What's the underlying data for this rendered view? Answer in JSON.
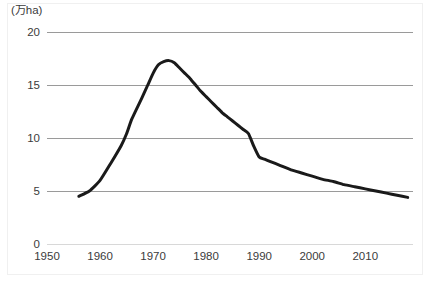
{
  "chart_data": {
    "type": "line",
    "title": "",
    "subtitle": "",
    "xlabel": "",
    "ylabel": "(万ha)",
    "unit_label": "(万ha)",
    "xlim": [
      1950,
      2019
    ],
    "ylim": [
      0,
      20
    ],
    "xticks": [
      1950,
      1960,
      1970,
      1980,
      1990,
      2000,
      2010
    ],
    "xtick_labels": [
      "1950",
      "1960",
      "1970",
      "1980",
      "1990",
      "2000",
      "2010"
    ],
    "yticks": [
      0,
      5,
      10,
      15,
      20
    ],
    "ytick_labels": [
      "0",
      "5",
      "10",
      "15",
      "20"
    ],
    "grid": "horizontal",
    "legend": "none",
    "line_color": "#1a1a1a",
    "line_width": 3,
    "grid_color": "#9a9a9a",
    "background_color": "#ffffff",
    "series": [
      {
        "name": "area",
        "x": [
          1956,
          1958,
          1960,
          1962,
          1964,
          1965,
          1966,
          1968,
          1969,
          1970,
          1971,
          1972,
          1973,
          1974,
          1975,
          1976,
          1977,
          1978,
          1979,
          1980,
          1981,
          1982,
          1983,
          1984,
          1985,
          1986,
          1987,
          1988,
          1989,
          1990,
          1991,
          1992,
          1994,
          1996,
          1998,
          2000,
          2002,
          2004,
          2006,
          2008,
          2010,
          2012,
          2014,
          2016,
          2018
        ],
        "values": [
          4.5,
          5.0,
          6.0,
          7.6,
          9.3,
          10.4,
          11.8,
          13.9,
          15.0,
          16.1,
          16.9,
          17.2,
          17.3,
          17.1,
          16.6,
          16.1,
          15.6,
          15.0,
          14.4,
          13.9,
          13.4,
          12.9,
          12.4,
          12.0,
          11.6,
          11.2,
          10.8,
          10.4,
          9.2,
          8.2,
          8.0,
          7.8,
          7.4,
          7.0,
          6.7,
          6.4,
          6.1,
          5.9,
          5.6,
          5.4,
          5.2,
          5.0,
          4.8,
          4.6,
          4.4
        ]
      }
    ],
    "annotations": {
      "peak_year": 1973,
      "peak_value": 17.3,
      "start_year": 1956,
      "start_value": 4.5,
      "end_year": 2018,
      "end_value": 4.4,
      "sharp_drop_from_year": 1988,
      "sharp_drop_to_year": 1990
    }
  }
}
